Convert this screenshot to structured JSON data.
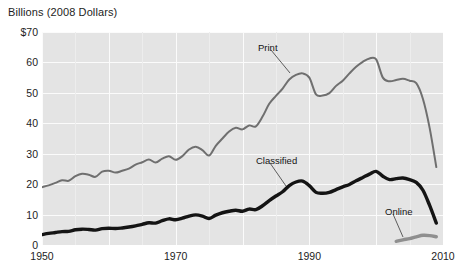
{
  "chart_data": {
    "type": "line",
    "title": "Billions (2008 Dollars)",
    "xlabel": "",
    "ylabel": "Billions (2008 Dollars)",
    "xlim": [
      1950,
      2010
    ],
    "ylim": [
      0,
      70
    ],
    "grid": true,
    "legend_position": "inline-annotations",
    "y_ticks": [
      {
        "value": 70,
        "label": "$70"
      },
      {
        "value": 60,
        "label": "60"
      },
      {
        "value": 50,
        "label": "50"
      },
      {
        "value": 40,
        "label": "40"
      },
      {
        "value": 30,
        "label": "30"
      },
      {
        "value": 20,
        "label": "20"
      },
      {
        "value": 10,
        "label": "10"
      },
      {
        "value": 0,
        "label": "0"
      }
    ],
    "x_ticks": [
      {
        "value": 1950,
        "label": "1950"
      },
      {
        "value": 1970,
        "label": "1970"
      },
      {
        "value": 1990,
        "label": "1990"
      },
      {
        "value": 2010,
        "label": "2010"
      }
    ],
    "series": [
      {
        "name": "Print",
        "color": "#6f6f6f",
        "width": 2.0,
        "x": [
          1950,
          1951,
          1952,
          1953,
          1954,
          1955,
          1956,
          1957,
          1958,
          1959,
          1960,
          1961,
          1962,
          1963,
          1964,
          1965,
          1966,
          1967,
          1968,
          1969,
          1970,
          1971,
          1972,
          1973,
          1974,
          1975,
          1976,
          1977,
          1978,
          1979,
          1980,
          1981,
          1982,
          1983,
          1984,
          1985,
          1986,
          1987,
          1988,
          1989,
          1990,
          1991,
          1992,
          1993,
          1994,
          1995,
          1996,
          1997,
          1998,
          1999,
          2000,
          2001,
          2002,
          2003,
          2004,
          2005,
          2006,
          2007,
          2008,
          2009
        ],
        "y": [
          19.0,
          19.6,
          20.4,
          21.3,
          21.1,
          22.6,
          23.4,
          23.1,
          22.4,
          24.1,
          24.4,
          23.8,
          24.4,
          25.1,
          26.4,
          27.2,
          28.1,
          27.1,
          28.4,
          29.2,
          28.0,
          29.2,
          31.4,
          32.3,
          31.2,
          29.4,
          32.6,
          35.0,
          37.3,
          38.5,
          38.0,
          39.3,
          39.0,
          42.2,
          46.4,
          49.0,
          51.4,
          54.4,
          55.9,
          56.4,
          55.0,
          49.5,
          49.1,
          49.9,
          52.3,
          54.0,
          56.4,
          58.6,
          60.2,
          61.3,
          61.0,
          55.0,
          53.8,
          54.2,
          54.6,
          54.0,
          53.2,
          48.0,
          38.5,
          25.6
        ]
      },
      {
        "name": "Classified",
        "color": "#141414",
        "width": 3.4,
        "x": [
          1950,
          1951,
          1952,
          1953,
          1954,
          1955,
          1956,
          1957,
          1958,
          1959,
          1960,
          1961,
          1962,
          1963,
          1964,
          1965,
          1966,
          1967,
          1968,
          1969,
          1970,
          1971,
          1972,
          1973,
          1974,
          1975,
          1976,
          1977,
          1978,
          1979,
          1980,
          1981,
          1982,
          1983,
          1984,
          1985,
          1986,
          1987,
          1988,
          1989,
          1990,
          1991,
          1992,
          1993,
          1994,
          1995,
          1996,
          1997,
          1998,
          1999,
          2000,
          2001,
          2002,
          2003,
          2004,
          2005,
          2006,
          2007,
          2008,
          2009
        ],
        "y": [
          3.4,
          3.8,
          4.1,
          4.4,
          4.5,
          5.0,
          5.2,
          5.1,
          4.9,
          5.4,
          5.5,
          5.4,
          5.6,
          5.9,
          6.3,
          6.8,
          7.3,
          7.2,
          8.0,
          8.6,
          8.3,
          8.8,
          9.5,
          9.9,
          9.5,
          8.7,
          9.8,
          10.6,
          11.1,
          11.4,
          11.1,
          11.8,
          11.6,
          12.9,
          14.6,
          16.1,
          17.5,
          19.5,
          20.7,
          21.0,
          19.5,
          17.3,
          17.0,
          17.3,
          18.2,
          19.1,
          19.9,
          21.1,
          22.2,
          23.3,
          24.2,
          22.6,
          21.5,
          21.8,
          22.0,
          21.5,
          20.6,
          18.0,
          13.0,
          7.2
        ]
      },
      {
        "name": "Online",
        "color": "#8f8f8f",
        "width": 3.4,
        "x": [
          2003,
          2004,
          2005,
          2006,
          2007,
          2008,
          2009
        ],
        "y": [
          1.2,
          1.7,
          2.1,
          2.7,
          3.2,
          3.1,
          2.7
        ]
      }
    ],
    "annotations": [
      {
        "label": "Print",
        "label_x": 258,
        "label_y": 42,
        "leader": [
          271,
          50,
          290,
          73
        ]
      },
      {
        "label": "Classified",
        "label_x": 256,
        "label_y": 155,
        "leader": [
          270,
          163,
          286,
          186
        ]
      },
      {
        "label": "Online",
        "label_x": 385,
        "label_y": 206,
        "leader": [
          393,
          214,
          403,
          237
        ]
      }
    ]
  }
}
